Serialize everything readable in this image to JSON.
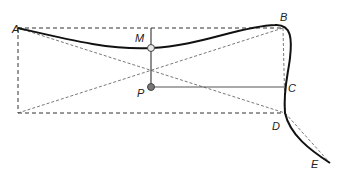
{
  "diagram": {
    "points": {
      "A": {
        "label": "A",
        "x": 18,
        "y": 28,
        "lx": 12,
        "ly": 20
      },
      "B": {
        "label": "B",
        "x": 283,
        "y": 28,
        "lx": 279,
        "ly": 21
      },
      "C": {
        "label": "C",
        "x": 285,
        "y": 87,
        "lx": 288,
        "ly": 92
      },
      "D": {
        "label": "D",
        "x": 285,
        "y": 113,
        "lx": 272,
        "ly": 129
      },
      "E": {
        "label": "E",
        "x": 330,
        "y": 163,
        "lx": 311,
        "ly": 167
      },
      "M": {
        "label": "M",
        "x": 151,
        "y": 48,
        "lx": 135,
        "ly": 42
      },
      "P": {
        "label": "P",
        "x": 151,
        "y": 87,
        "lx": 137,
        "ly": 96
      }
    },
    "colors": {
      "curve": "#111111",
      "dashed": "#333333",
      "solid_guide": "#555555",
      "m_fill": "#e8e8e8",
      "p_fill": "#777777"
    }
  }
}
